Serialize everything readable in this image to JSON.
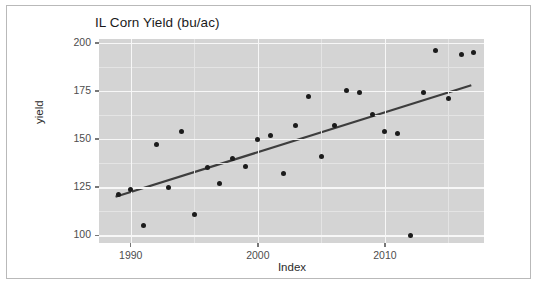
{
  "window": {
    "background_color": "#ffffff",
    "border_color": "#b9b9b9"
  },
  "chart_data": {
    "type": "scatter",
    "title": "IL Corn Yield (bu/ac)",
    "xlabel": "Index",
    "ylabel": "yield",
    "xlim": [
      1987.5,
      2017.8
    ],
    "ylim": [
      96,
      202
    ],
    "grid": true,
    "legend": false,
    "panel_color": "#d4d4d4",
    "gridline_color": "#f7f7f7",
    "point_color": "#1b1b1b",
    "line_color": "#3d3d3d",
    "xticks": [
      1990,
      2000,
      2010
    ],
    "xtick_labels": [
      "1990",
      "2000",
      "2010"
    ],
    "yticks": [
      100,
      125,
      150,
      175,
      200
    ],
    "ytick_labels": [
      "100",
      "125",
      "150",
      "175",
      "200"
    ],
    "x": [
      1989,
      1990,
      1991,
      1992,
      1993,
      1994,
      1995,
      1996,
      1997,
      1998,
      1999,
      2000,
      2001,
      2002,
      2003,
      2004,
      2005,
      2006,
      2007,
      2008,
      2009,
      2010,
      2011,
      2012,
      2013,
      2014,
      2015,
      2016,
      2017
    ],
    "values": [
      121,
      124,
      105,
      147,
      125,
      154,
      111,
      135,
      127,
      140,
      136,
      150,
      152,
      132,
      157,
      172,
      141,
      157,
      175,
      174,
      163,
      154,
      153,
      100,
      174,
      196,
      171,
      194,
      195
    ],
    "series": [
      {
        "name": "yield",
        "points": [
          {
            "x": 1989,
            "y": 121
          },
          {
            "x": 1990,
            "y": 124
          },
          {
            "x": 1991,
            "y": 105
          },
          {
            "x": 1992,
            "y": 147
          },
          {
            "x": 1993,
            "y": 125
          },
          {
            "x": 1994,
            "y": 154
          },
          {
            "x": 1995,
            "y": 111
          },
          {
            "x": 1996,
            "y": 135
          },
          {
            "x": 1997,
            "y": 127
          },
          {
            "x": 1998,
            "y": 140
          },
          {
            "x": 1999,
            "y": 136
          },
          {
            "x": 2000,
            "y": 150
          },
          {
            "x": 2001,
            "y": 152
          },
          {
            "x": 2002,
            "y": 132
          },
          {
            "x": 2003,
            "y": 157
          },
          {
            "x": 2004,
            "y": 172
          },
          {
            "x": 2005,
            "y": 141
          },
          {
            "x": 2006,
            "y": 157
          },
          {
            "x": 2007,
            "y": 175
          },
          {
            "x": 2008,
            "y": 174
          },
          {
            "x": 2009,
            "y": 163
          },
          {
            "x": 2010,
            "y": 154
          },
          {
            "x": 2011,
            "y": 153
          },
          {
            "x": 2012,
            "y": 100
          },
          {
            "x": 2013,
            "y": 174
          },
          {
            "x": 2014,
            "y": 196
          },
          {
            "x": 2015,
            "y": 171
          },
          {
            "x": 2016,
            "y": 194
          },
          {
            "x": 2017,
            "y": 195
          }
        ]
      }
    ],
    "trendline": {
      "name": "linear-fit",
      "x_start": 1988.8,
      "y_start": 120,
      "x_end": 2016.8,
      "y_end": 178
    }
  }
}
